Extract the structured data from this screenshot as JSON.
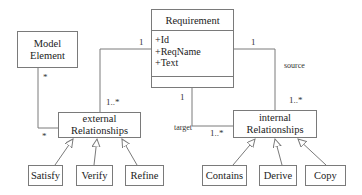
{
  "diagram": {
    "type": "UML class diagram",
    "classes": {
      "requirement": {
        "name": "Requirement",
        "attributes": [
          "+Id",
          "+ReqName",
          "+Text"
        ]
      },
      "model_element": {
        "name_line1": "Model",
        "name_line2": "Element"
      },
      "external_relationships": {
        "name_line1": "external",
        "name_line2": "Relationships"
      },
      "internal_relationships": {
        "name_line1": "internal",
        "name_line2": "Relationships"
      },
      "satisfy": {
        "name": "Satisfy"
      },
      "verify": {
        "name": "Verify"
      },
      "refine": {
        "name": "Refine"
      },
      "contains": {
        "name": "Contains"
      },
      "derive": {
        "name": "Derive"
      },
      "copy": {
        "name": "Copy"
      }
    },
    "associations": {
      "req_to_external": {
        "req_end": "1",
        "rel_end": "1..*"
      },
      "model_to_external": {
        "model_end": "*",
        "rel_end": "*"
      },
      "req_source_internal": {
        "req_end": "1",
        "role": "source",
        "rel_end": "1..*"
      },
      "req_target_internal": {
        "req_end": "1",
        "role": "target",
        "rel_end": "1..*"
      }
    },
    "generalizations": [
      {
        "child": "Satisfy",
        "parent": "external Relationships"
      },
      {
        "child": "Verify",
        "parent": "external Relationships"
      },
      {
        "child": "Refine",
        "parent": "external Relationships"
      },
      {
        "child": "Contains",
        "parent": "internal Relationships"
      },
      {
        "child": "Derive",
        "parent": "internal Relationships"
      },
      {
        "child": "Copy",
        "parent": "internal Relationships"
      }
    ],
    "colors": {
      "line": "#7a7a7a",
      "background": "#ffffff",
      "text": "#222222"
    }
  }
}
